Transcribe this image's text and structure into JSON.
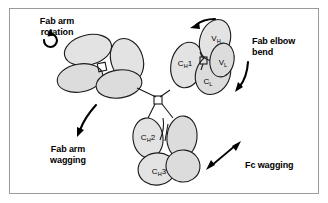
{
  "figure": {
    "background_color": "#ffffff",
    "frame_color": "#9a9a9a",
    "domain_fill_color": "#e3e3e3",
    "outline_color": "#1a1a1a"
  },
  "domain_labels": {
    "vh": {
      "main": "V",
      "sub": "H"
    },
    "vl": {
      "main": "V",
      "sub": "L"
    },
    "ch1": {
      "pre": "C",
      "sub": "H",
      "post": "1"
    },
    "cl": {
      "main": "C",
      "sub": "L"
    },
    "ch2": {
      "pre": "C",
      "sub": "H",
      "post": "2"
    },
    "ch3": {
      "pre": "C",
      "sub": "H",
      "post": "3"
    }
  },
  "annotations": {
    "fab_arm_rotation": "Fab arm\nrotation",
    "fab_elbow_bend": "Fab elbow\nbend",
    "fab_arm_wagging": "Fab arm\nwagging",
    "fc_wagging": "Fc wagging"
  },
  "icons": {
    "rotation_arrow": "circular-rotation-arrow-icon",
    "elbow_top_arrow": "curved-left-arrow-icon",
    "elbow_side_arrow": "curved-down-left-arrow-icon",
    "fab_wag_arrow": "curved-down-left-arrow-icon",
    "fc_wag_arrow": "double-headed-diagonal-arrow-icon"
  }
}
